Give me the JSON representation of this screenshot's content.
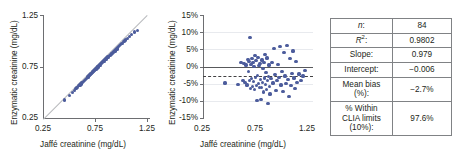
{
  "figure": {
    "marker_color": "#4c5c9c",
    "identity_line_color": "#b7b9bc",
    "zero_line_color": "#58595b",
    "bias_line_color": "#414042"
  },
  "chart_data": [
    {
      "type": "scatter",
      "name": "method-comparison-scatter",
      "title": "",
      "xlabel": "Jaffé creatinine (mg/dL)",
      "ylabel": "Enzymatic creatinine (mg/dL)",
      "xlim": [
        0.25,
        1.35
      ],
      "ylim": [
        0.25,
        1.35
      ],
      "xticks": [
        "0.25",
        "0.75",
        "1.25"
      ],
      "yticks": [
        "1.25",
        "0.75",
        "0.25"
      ],
      "xtick_values": [
        0.25,
        0.75,
        1.25
      ],
      "ytick_values": [
        1.25,
        0.75,
        0.25
      ],
      "grid": false,
      "legend": "none",
      "reference_line": "identity (y = x)",
      "points": [
        [
          0.47,
          0.45
        ],
        [
          0.52,
          0.5
        ],
        [
          0.55,
          0.53
        ],
        [
          0.57,
          0.55
        ],
        [
          0.59,
          0.57
        ],
        [
          0.6,
          0.58
        ],
        [
          0.62,
          0.6
        ],
        [
          0.63,
          0.61
        ],
        [
          0.64,
          0.62
        ],
        [
          0.65,
          0.63
        ],
        [
          0.66,
          0.64
        ],
        [
          0.67,
          0.65
        ],
        [
          0.68,
          0.655
        ],
        [
          0.69,
          0.665
        ],
        [
          0.7,
          0.675
        ],
        [
          0.705,
          0.69
        ],
        [
          0.71,
          0.7
        ],
        [
          0.715,
          0.695
        ],
        [
          0.72,
          0.705
        ],
        [
          0.725,
          0.715
        ],
        [
          0.73,
          0.71
        ],
        [
          0.735,
          0.72
        ],
        [
          0.74,
          0.725
        ],
        [
          0.745,
          0.735
        ],
        [
          0.75,
          0.73
        ],
        [
          0.755,
          0.74
        ],
        [
          0.76,
          0.745
        ],
        [
          0.765,
          0.75
        ],
        [
          0.77,
          0.755
        ],
        [
          0.775,
          0.76
        ],
        [
          0.78,
          0.765
        ],
        [
          0.785,
          0.77
        ],
        [
          0.79,
          0.775
        ],
        [
          0.795,
          0.78
        ],
        [
          0.8,
          0.775
        ],
        [
          0.805,
          0.79
        ],
        [
          0.81,
          0.8
        ],
        [
          0.815,
          0.805
        ],
        [
          0.82,
          0.8
        ],
        [
          0.825,
          0.815
        ],
        [
          0.83,
          0.82
        ],
        [
          0.835,
          0.825
        ],
        [
          0.84,
          0.82
        ],
        [
          0.845,
          0.835
        ],
        [
          0.85,
          0.84
        ],
        [
          0.855,
          0.845
        ],
        [
          0.86,
          0.85
        ],
        [
          0.865,
          0.855
        ],
        [
          0.87,
          0.86
        ],
        [
          0.875,
          0.865
        ],
        [
          0.88,
          0.86
        ],
        [
          0.885,
          0.875
        ],
        [
          0.89,
          0.88
        ],
        [
          0.895,
          0.885
        ],
        [
          0.9,
          0.88
        ],
        [
          0.905,
          0.895
        ],
        [
          0.91,
          0.9
        ],
        [
          0.915,
          0.905
        ],
        [
          0.92,
          0.9
        ],
        [
          0.925,
          0.915
        ],
        [
          0.93,
          0.92
        ],
        [
          0.94,
          0.925
        ],
        [
          0.95,
          0.935
        ],
        [
          0.955,
          0.945
        ],
        [
          0.96,
          0.94
        ],
        [
          0.97,
          0.955
        ],
        [
          0.98,
          0.965
        ],
        [
          0.99,
          0.97
        ],
        [
          1.0,
          0.985
        ],
        [
          1.01,
          0.99
        ],
        [
          1.02,
          1.0
        ],
        [
          1.03,
          1.02
        ],
        [
          1.04,
          1.025
        ],
        [
          1.05,
          1.035
        ],
        [
          1.06,
          1.045
        ],
        [
          1.07,
          1.05
        ],
        [
          1.08,
          1.07
        ],
        [
          1.09,
          1.075
        ],
        [
          1.1,
          1.085
        ],
        [
          1.12,
          1.1
        ],
        [
          1.14,
          1.12
        ],
        [
          1.16,
          1.14
        ],
        [
          1.19,
          1.17
        ],
        [
          1.22,
          1.19
        ]
      ]
    },
    {
      "type": "scatter",
      "name": "bias-plot",
      "title": "",
      "xlabel": "Jaffé creatinine (mg/dL)",
      "ylabel": "Enzymatic creatinine (mg/dL)",
      "xlim": [
        0.25,
        1.35
      ],
      "ylim": [
        -15,
        15
      ],
      "xticks": [
        "0.25",
        "0.75",
        "1.25"
      ],
      "yticks": [
        "15%",
        "10%",
        "5%",
        "0%",
        "-5%",
        "-10%",
        "-15%"
      ],
      "xtick_values": [
        0.25,
        0.75,
        1.25
      ],
      "ytick_values": [
        15,
        10,
        5,
        0,
        -5,
        -10,
        -15
      ],
      "grid": true,
      "legend": "none",
      "zero_line": 0,
      "mean_bias_line": -2.7,
      "points": [
        [
          0.47,
          -4.6
        ],
        [
          0.6,
          -5.0
        ],
        [
          0.63,
          1.2
        ],
        [
          0.65,
          -3.8
        ],
        [
          0.66,
          1.0
        ],
        [
          0.67,
          -4.4
        ],
        [
          0.68,
          0.6
        ],
        [
          0.69,
          -5.2
        ],
        [
          0.7,
          2.2
        ],
        [
          0.705,
          -1.2
        ],
        [
          0.71,
          1.6
        ],
        [
          0.715,
          -4.0
        ],
        [
          0.72,
          8.6
        ],
        [
          0.725,
          -6.2
        ],
        [
          0.73,
          0.8
        ],
        [
          0.735,
          -3.4
        ],
        [
          0.74,
          2.4
        ],
        [
          0.745,
          -5.6
        ],
        [
          0.75,
          1.4
        ],
        [
          0.755,
          -4.2
        ],
        [
          0.76,
          0.2
        ],
        [
          0.765,
          -6.6
        ],
        [
          0.77,
          3.2
        ],
        [
          0.775,
          -3.0
        ],
        [
          0.78,
          1.8
        ],
        [
          0.785,
          -5.4
        ],
        [
          0.79,
          -9.6
        ],
        [
          0.795,
          -2.4
        ],
        [
          0.8,
          2.8
        ],
        [
          0.805,
          -4.8
        ],
        [
          0.81,
          0.4
        ],
        [
          0.815,
          -6.0
        ],
        [
          0.82,
          1.0
        ],
        [
          0.825,
          -3.6
        ],
        [
          0.83,
          -9.4
        ],
        [
          0.835,
          -5.8
        ],
        [
          0.84,
          2.0
        ],
        [
          0.845,
          -4.4
        ],
        [
          0.85,
          -0.4
        ],
        [
          0.855,
          -7.2
        ],
        [
          0.86,
          1.2
        ],
        [
          0.865,
          -3.2
        ],
        [
          0.87,
          3.6
        ],
        [
          0.875,
          -5.0
        ],
        [
          0.88,
          -1.6
        ],
        [
          0.885,
          -6.4
        ],
        [
          0.89,
          2.6
        ],
        [
          0.895,
          -4.0
        ],
        [
          0.9,
          -10.6
        ],
        [
          0.905,
          -2.8
        ],
        [
          0.91,
          0.6
        ],
        [
          0.915,
          -5.6
        ],
        [
          0.92,
          -7.8
        ],
        [
          0.93,
          -3.4
        ],
        [
          0.94,
          1.4
        ],
        [
          0.95,
          -4.6
        ],
        [
          0.96,
          5.4
        ],
        [
          0.97,
          -2.2
        ],
        [
          0.98,
          -6.8
        ],
        [
          0.99,
          -4.0
        ],
        [
          1.0,
          0.8
        ],
        [
          1.01,
          -3.0
        ],
        [
          1.02,
          5.8
        ],
        [
          1.03,
          -5.2
        ],
        [
          1.04,
          -1.4
        ],
        [
          1.05,
          -7.0
        ],
        [
          1.06,
          4.2
        ],
        [
          1.07,
          -2.6
        ],
        [
          1.08,
          -4.8
        ],
        [
          1.09,
          6.2
        ],
        [
          1.1,
          -3.6
        ],
        [
          1.11,
          -8.6
        ],
        [
          1.12,
          2.4
        ],
        [
          1.13,
          -5.4
        ],
        [
          1.14,
          -1.8
        ],
        [
          1.15,
          4.6
        ],
        [
          1.16,
          -3.2
        ],
        [
          1.17,
          -6.2
        ],
        [
          1.18,
          1.6
        ],
        [
          1.19,
          -4.4
        ],
        [
          1.21,
          -2.0
        ],
        [
          1.23,
          -3.8
        ],
        [
          1.25,
          -2.6
        ],
        [
          1.27,
          -1.0
        ]
      ]
    }
  ],
  "stats_table": {
    "rows": [
      {
        "label": "n:",
        "label_html": "<span class=\"ital\">n</span>:",
        "value": "84"
      },
      {
        "label": "R2:",
        "label_html": "<span class=\"ital\">R</span><sup>2</sup>:",
        "value": "0.9802"
      },
      {
        "label": "Slope:",
        "label_html": "Slope:",
        "value": "0.979"
      },
      {
        "label": "Intercept:",
        "label_html": "Intercept:",
        "value": "−0.006"
      },
      {
        "label": "Mean bias (%):",
        "label_html": "Mean bias<br>(%):",
        "value": "−2.7%"
      },
      {
        "label": "% Within CLIA limits (10%):",
        "label_html": "% Within<br>CLIA limits<br>(10%):",
        "value": "97.6%"
      }
    ]
  }
}
